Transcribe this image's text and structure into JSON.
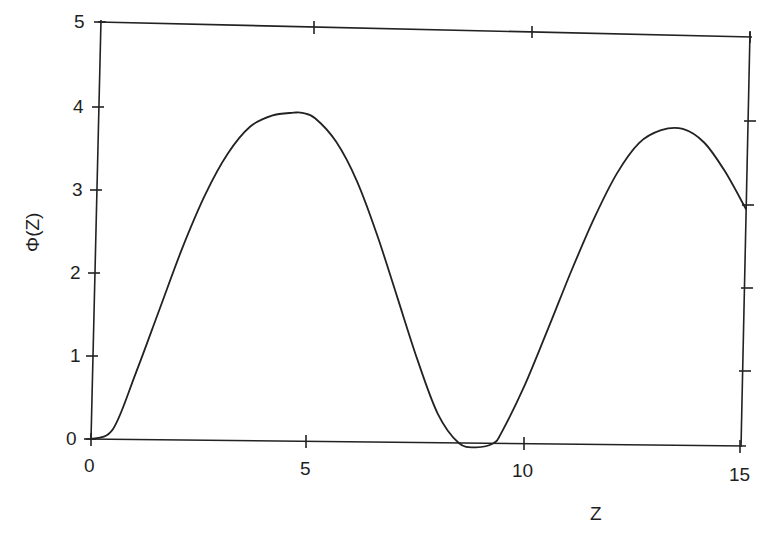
{
  "chart_data": {
    "type": "line",
    "title": "",
    "xlabel": "Z",
    "ylabel": "Φ(Z)",
    "xlim": [
      0,
      15
    ],
    "ylim": [
      0,
      5
    ],
    "grid": false,
    "legend": null,
    "x_ticks": [
      "0",
      "5",
      "10",
      "15"
    ],
    "y_ticks": [
      "0",
      "1",
      "2",
      "3",
      "4",
      "5"
    ],
    "series": [
      {
        "name": "Φ(Z)",
        "x": [
          0,
          0.5,
          1.0,
          1.5,
          2.0,
          2.5,
          3.0,
          3.5,
          4.0,
          4.5,
          4.7,
          5.0,
          5.5,
          6.0,
          6.5,
          7.0,
          7.5,
          8.0,
          8.5,
          8.9,
          9.3,
          9.5,
          10.0,
          10.5,
          11.0,
          11.5,
          12.0,
          12.5,
          13.0,
          13.5,
          14.0,
          14.5,
          15.0
        ],
        "values": [
          0,
          0.12,
          0.8,
          1.55,
          2.3,
          2.95,
          3.45,
          3.78,
          3.92,
          3.96,
          3.96,
          3.9,
          3.62,
          3.15,
          2.5,
          1.75,
          1.0,
          0.35,
          0.0,
          -0.05,
          0.0,
          0.15,
          0.72,
          1.4,
          2.1,
          2.75,
          3.3,
          3.68,
          3.84,
          3.86,
          3.7,
          3.35,
          2.9
        ]
      }
    ]
  },
  "axes": {
    "x_tick_labels": [
      "0",
      "5",
      "10",
      "15"
    ],
    "y_tick_labels": [
      "0",
      "1",
      "2",
      "3",
      "4",
      "5"
    ],
    "x_axis_title": "Z",
    "y_axis_title": "Φ(Z)"
  },
  "style": {
    "line_color": "#222222",
    "axis_color": "#222222",
    "background": "#ffffff"
  }
}
